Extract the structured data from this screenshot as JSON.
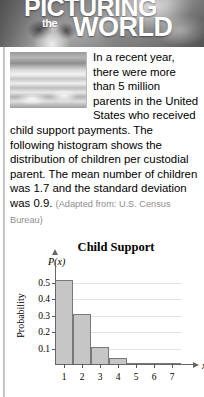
{
  "banner": {
    "word1": "PICTURING",
    "word2": "the",
    "word3": "WORLD"
  },
  "article": {
    "paragraph": "In a recent year, there were more than 5 million parents in the United States who received child support payments. The following histogram shows the distribution of children per custodial parent. The mean number of children was 1.7 and the standard deviation was 0.9.",
    "attribution": "(Adapted from: U.S. Census Bureau)"
  },
  "chart_data": {
    "type": "bar",
    "title": "Child Support",
    "xlabel": "x",
    "ylabel": "Probability",
    "y_symbol": "P(x)",
    "categories": [
      "1",
      "2",
      "3",
      "4",
      "5",
      "6",
      "7"
    ],
    "values": [
      0.52,
      0.31,
      0.11,
      0.04,
      0.012,
      0.007,
      0.004
    ],
    "ytick_labels": [
      "0.1",
      "0.2",
      "0.3",
      "0.4",
      "0.5"
    ],
    "ytick_values": [
      0.1,
      0.2,
      0.3,
      0.4,
      0.5
    ],
    "ylim": [
      0,
      0.58
    ],
    "xlim": [
      0.5,
      7.5
    ],
    "grid": true,
    "legend": "none",
    "bar_fill": "#c6c6c6",
    "bar_stroke": "#787878",
    "grid_color": "#e2e2e2"
  }
}
